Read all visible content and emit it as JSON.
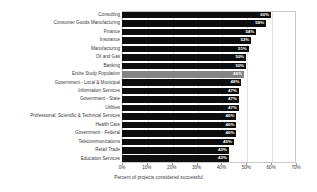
{
  "chart_data": {
    "type": "bar",
    "orientation": "horizontal",
    "title": "",
    "xlabel": "Percent of projects considered successful",
    "ylabel": "",
    "xlim": [
      0,
      70
    ],
    "xticks": [
      "0%",
      "10%",
      "20%",
      "30%",
      "40%",
      "50%",
      "60%",
      "70%"
    ],
    "xtick_values": [
      0,
      10,
      20,
      30,
      40,
      50,
      60,
      70
    ],
    "grid": true,
    "legend": "none",
    "highlight_category": "Entire Study Population",
    "categories": [
      "Consulting",
      "Consumer Goods Manufacturing",
      "Finance",
      "Insurance",
      "Manufacturing",
      "Oil and Gas",
      "Banking",
      "Entire Study Population",
      "Government - Local & Municipal",
      "Information Services",
      "Government - State",
      "Utilities",
      "Professional, Scientific & Technical Services",
      "Health Care",
      "Government - Federal",
      "Telecommunications",
      "Retail Trade",
      "Education Services"
    ],
    "values": [
      60,
      58,
      54,
      52,
      51,
      50,
      50,
      49,
      48,
      47,
      47,
      47,
      46,
      46,
      46,
      45,
      43,
      43
    ],
    "value_labels": [
      "60%",
      "58%",
      "54%",
      "52%",
      "51%",
      "50%",
      "50%",
      "49%",
      "48%",
      "47%",
      "47%",
      "47%",
      "46%",
      "46%",
      "46%",
      "45%",
      "43%",
      "43%"
    ]
  },
  "colors": {
    "bar": "#0d0d0d",
    "bar_highlight": "#848484",
    "value_text": "#ffffff",
    "axis_text": "#3a3a3a",
    "gridline": "#e2e2e2",
    "plot_border": "#c9c9c9",
    "background": "#ffffff"
  }
}
